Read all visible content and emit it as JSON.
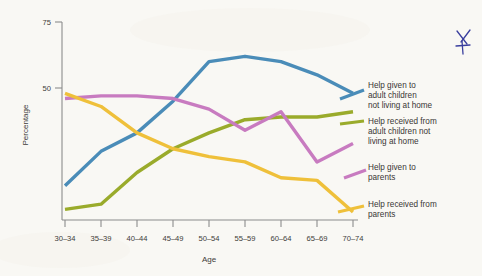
{
  "chart_data": {
    "type": "line",
    "title": "",
    "xlabel": "Age",
    "ylabel": "Percentage",
    "categories": [
      "30–34",
      "35–39",
      "40–44",
      "45–49",
      "50–54",
      "55–59",
      "60–64",
      "65–69",
      "70–74"
    ],
    "yticks": [
      50,
      75
    ],
    "ytick_labels": [
      "50",
      "75"
    ],
    "ylim": [
      0,
      80
    ],
    "grid": false,
    "legend_position": "right",
    "series": [
      {
        "name": "Help given to adult children not living at home",
        "color": "#4a8cb8",
        "values": [
          13,
          26,
          33,
          45,
          60,
          62,
          60,
          55,
          48
        ]
      },
      {
        "name": "Help received from adult children not living at home",
        "color": "#9aab2b",
        "values": [
          4,
          6,
          18,
          27,
          33,
          38,
          39,
          39,
          41
        ]
      },
      {
        "name": "Help given to parents",
        "color": "#c87bc0",
        "values": [
          46,
          47,
          47,
          46,
          42,
          34,
          41,
          22,
          29
        ]
      },
      {
        "name": "Help received from parents",
        "color": "#efc03a",
        "values": [
          48,
          43,
          33,
          27,
          24,
          22,
          16,
          15,
          3
        ]
      }
    ]
  },
  "legend": [
    {
      "label_lines": [
        "Help given to",
        "adult children",
        "not living at home"
      ],
      "color": "#4a8cb8"
    },
    {
      "label_lines": [
        "Help received from",
        "adult children not",
        "living at home"
      ],
      "color": "#9aab2b"
    },
    {
      "label_lines": [
        "Help given to",
        "parents"
      ],
      "color": "#c87bc0"
    },
    {
      "label_lines": [
        "Help received from",
        "parents"
      ],
      "color": "#efc03a"
    }
  ],
  "legend_text": {
    "s0_l0": "Help given to",
    "s0_l1": "adult children",
    "s0_l2": "not living at home",
    "s1_l0": "Help received from",
    "s1_l1": "adult children not",
    "s1_l2": "living at home",
    "s2_l0": "Help given to",
    "s2_l1": "parents",
    "s3_l0": "Help received from",
    "s3_l1": "parents"
  },
  "axis": {
    "ylabel": "Percentage",
    "xlabel": "Age",
    "ytick_75": "75",
    "ytick_50": "50",
    "xtick_0": "30–34",
    "xtick_1": "35–39",
    "xtick_2": "40–44",
    "xtick_3": "45–49",
    "xtick_4": "50–54",
    "xtick_5": "55–59",
    "xtick_6": "60–64",
    "xtick_7": "65–69",
    "xtick_8": "70–74"
  },
  "annotation": {
    "name": "handwritten-star-mark",
    "color": "#3a3f9e"
  }
}
